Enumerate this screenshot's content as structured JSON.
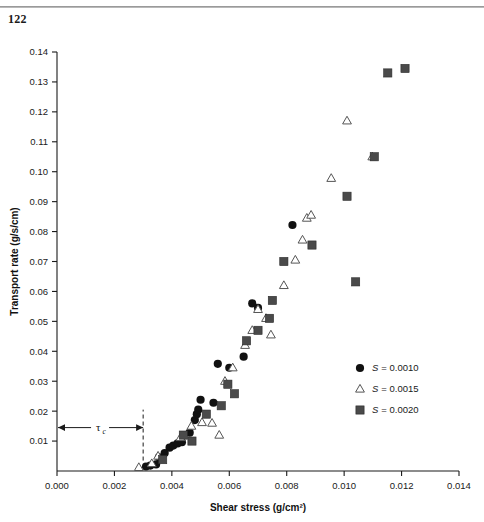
{
  "page": {
    "folio": "122"
  },
  "chart_data": {
    "type": "scatter",
    "title": "",
    "xlabel": "Shear stress (g/cm²)",
    "ylabel": "Transport rate (g/s/cm)",
    "xlim": [
      0.0,
      0.014
    ],
    "ylim": [
      0.0,
      0.14
    ],
    "xticks": [
      0.0,
      0.002,
      0.004,
      0.006,
      0.008,
      0.01,
      0.012,
      0.014
    ],
    "xticklabels": [
      "0.000",
      "0.002",
      "0.004",
      "0.006",
      "0.008",
      "0.010",
      "0.012",
      "0.014"
    ],
    "yticks": [
      0.01,
      0.02,
      0.03,
      0.04,
      0.05,
      0.06,
      0.07,
      0.08,
      0.09,
      0.1,
      0.11,
      0.12,
      0.13,
      0.14
    ],
    "yticklabels": [
      "0.01",
      "0.02",
      "0.03",
      "0.04",
      "0.05",
      "0.06",
      "0.07",
      "0.08",
      "0.09",
      "0.10",
      "0.11",
      "0.12",
      "0.13",
      "0.14"
    ],
    "grid": false,
    "legend_position": "lower-right",
    "annotations": [
      {
        "name": "critical-shear-stress",
        "label": "τ",
        "sublabel": "c",
        "type": "double-arrow",
        "x_from": 0.0,
        "x_to": 0.003,
        "y": 0.0145,
        "dashed_vline_x": 0.003,
        "dashed_vline_y_from": 0.0035,
        "dashed_vline_y_to": 0.0205
      }
    ],
    "series": [
      {
        "name": "S = 0.0010",
        "label_prefix": "S",
        "label_value": "= 0.0010",
        "marker": "filled-circle",
        "color": "#111111",
        "points": [
          [
            0.0031,
            0.0015
          ],
          [
            0.00325,
            0.0018
          ],
          [
            0.00345,
            0.0022
          ],
          [
            0.00355,
            0.0046
          ],
          [
            0.00375,
            0.006
          ],
          [
            0.00392,
            0.0078
          ],
          [
            0.00405,
            0.0085
          ],
          [
            0.0042,
            0.0092
          ],
          [
            0.00435,
            0.0096
          ],
          [
            0.00462,
            0.0128
          ],
          [
            0.0048,
            0.017
          ],
          [
            0.00487,
            0.019
          ],
          [
            0.00492,
            0.0205
          ],
          [
            0.005,
            0.0238
          ],
          [
            0.00545,
            0.0228
          ],
          [
            0.0056,
            0.0358
          ],
          [
            0.006,
            0.0345
          ],
          [
            0.0065,
            0.0382
          ],
          [
            0.0068,
            0.056
          ],
          [
            0.007,
            0.0545
          ],
          [
            0.0082,
            0.0822
          ]
        ]
      },
      {
        "name": "S = 0.0015",
        "label_prefix": "S",
        "label_value": "= 0.0015",
        "marker": "open-triangle",
        "color": "#ffffff",
        "points": [
          [
            0.00285,
            0.0012
          ],
          [
            0.0033,
            0.0025
          ],
          [
            0.00352,
            0.005
          ],
          [
            0.0043,
            0.0112
          ],
          [
            0.00468,
            0.015
          ],
          [
            0.00505,
            0.0162
          ],
          [
            0.0054,
            0.016
          ],
          [
            0.00565,
            0.012
          ],
          [
            0.00585,
            0.03
          ],
          [
            0.00612,
            0.0345
          ],
          [
            0.00655,
            0.042
          ],
          [
            0.0068,
            0.047
          ],
          [
            0.007,
            0.054
          ],
          [
            0.00728,
            0.051
          ],
          [
            0.00745,
            0.0455
          ],
          [
            0.0079,
            0.062
          ],
          [
            0.0083,
            0.0705
          ],
          [
            0.00855,
            0.0772
          ],
          [
            0.0087,
            0.0845
          ],
          [
            0.00885,
            0.0855
          ],
          [
            0.00955,
            0.0978
          ],
          [
            0.0101,
            0.117
          ],
          [
            0.01098,
            0.105
          ]
        ]
      },
      {
        "name": "S = 0.0020",
        "label_prefix": "S",
        "label_value": "= 0.0020",
        "marker": "filled-square",
        "color": "#4a4a4a",
        "points": [
          [
            0.00368,
            0.0038
          ],
          [
            0.0044,
            0.012
          ],
          [
            0.0047,
            0.01
          ],
          [
            0.0052,
            0.019
          ],
          [
            0.00572,
            0.0218
          ],
          [
            0.00595,
            0.029
          ],
          [
            0.00618,
            0.0258
          ],
          [
            0.0066,
            0.0435
          ],
          [
            0.007,
            0.047
          ],
          [
            0.0074,
            0.051
          ],
          [
            0.0075,
            0.057
          ],
          [
            0.0079,
            0.07
          ],
          [
            0.00888,
            0.0755
          ],
          [
            0.0101,
            0.0918
          ],
          [
            0.0104,
            0.0632
          ],
          [
            0.01105,
            0.105
          ],
          [
            0.01152,
            0.133
          ],
          [
            0.01212,
            0.1345
          ]
        ]
      }
    ]
  },
  "legend": {
    "items": [
      {
        "marker": "filled-circle",
        "prefix": "S",
        "text": "= 0.0010"
      },
      {
        "marker": "open-triangle",
        "prefix": "S",
        "text": "= 0.0015"
      },
      {
        "marker": "filled-square",
        "prefix": "S",
        "text": "= 0.0020"
      }
    ]
  }
}
